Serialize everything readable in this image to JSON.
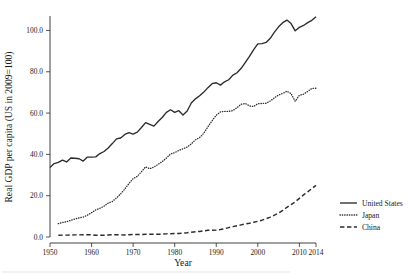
{
  "chart_data": {
    "type": "line",
    "title": "",
    "xlabel": "Year",
    "ylabel": "Real GDP per capita (US in 2009=100)",
    "xlim": [
      1950,
      2014
    ],
    "ylim": [
      0,
      107
    ],
    "grid": false,
    "legend_position": "right",
    "x_tick_labels": [
      "1950",
      "1960",
      "1970",
      "1980",
      "1990",
      "2000",
      "2010",
      "2014"
    ],
    "x_tick_values": [
      1950,
      1960,
      1970,
      1980,
      1990,
      2000,
      2010,
      2014
    ],
    "y_tick_labels": [
      "0.0",
      "20.0",
      "40.0",
      "60.0",
      "80.0",
      "100.0"
    ],
    "y_tick_values": [
      0,
      20,
      40,
      60,
      80,
      100
    ],
    "x": [
      1950,
      1951,
      1952,
      1953,
      1954,
      1955,
      1956,
      1957,
      1958,
      1959,
      1960,
      1961,
      1962,
      1963,
      1964,
      1965,
      1966,
      1967,
      1968,
      1969,
      1970,
      1971,
      1972,
      1973,
      1974,
      1975,
      1976,
      1977,
      1978,
      1979,
      1980,
      1981,
      1982,
      1983,
      1984,
      1985,
      1986,
      1987,
      1988,
      1989,
      1990,
      1991,
      1992,
      1993,
      1994,
      1995,
      1996,
      1997,
      1998,
      1999,
      2000,
      2001,
      2002,
      2003,
      2004,
      2005,
      2006,
      2007,
      2008,
      2009,
      2010,
      2011,
      2012,
      2013,
      2014
    ],
    "series": [
      {
        "name": "United States",
        "style": "solid",
        "color": "#2b2b2b",
        "values": [
          29.8,
          31.5,
          32.0,
          33.0,
          32.2,
          33.9,
          33.8,
          33.6,
          32.6,
          34.3,
          34.3,
          34.4,
          35.8,
          36.7,
          38.2,
          40.1,
          42.1,
          42.5,
          44.0,
          44.8,
          44.2,
          45.0,
          47.0,
          49.1,
          48.3,
          47.6,
          49.6,
          51.3,
          53.5,
          54.6,
          53.5,
          54.2,
          52.4,
          54.1,
          57.5,
          59.3,
          60.6,
          62.2,
          64.1,
          65.8,
          66.2,
          65.2,
          66.6,
          67.5,
          69.5,
          70.5,
          72.4,
          75.0,
          77.5,
          80.4,
          82.9,
          83.0,
          83.5,
          85.3,
          87.9,
          90.2,
          92.0,
          93.1,
          91.6,
          88.5,
          90.0,
          90.8,
          92.0,
          93.0,
          94.5
        ],
        "note": "rises from about 29.8 in 1950 to a 2007 peak near 105.5 (plotted scale), dips in 2009, recovers to about 106.5 by 2014"
      },
      {
        "name": "Japan",
        "style": "dotted",
        "color": "#2b2b2b",
        "values": [
          null,
          null,
          4.9,
          5.3,
          5.6,
          6.1,
          6.6,
          7.0,
          7.3,
          8.0,
          8.9,
          9.9,
          10.5,
          11.3,
          12.4,
          13.0,
          14.3,
          15.8,
          17.6,
          19.6,
          21.4,
          22.2,
          23.9,
          25.7,
          25.0,
          25.6,
          26.6,
          27.6,
          28.9,
          30.4,
          30.9,
          31.7,
          32.3,
          32.9,
          34.1,
          35.6,
          36.4,
          38.0,
          40.4,
          42.6,
          44.6,
          45.8,
          46.0,
          46.0,
          46.3,
          47.4,
          48.6,
          48.9,
          48.0,
          47.8,
          48.8,
          48.9,
          49.0,
          49.8,
          51.0,
          52.0,
          52.6,
          53.4,
          52.5,
          49.7,
          51.9,
          52.3,
          53.3,
          54.4,
          54.5
        ],
        "note": "starts near 5 in 1952, climbs steeply through the 1960s-80s, peaks about 68 in 1996-97, plateaus near 66-72 and ends near 72 in 2014"
      },
      {
        "name": "China",
        "style": "dashed",
        "color": "#2b2b2b",
        "values": [
          null,
          null,
          1.6,
          1.7,
          1.7,
          1.8,
          1.9,
          1.9,
          2.1,
          2.1,
          2.0,
          1.5,
          1.5,
          1.6,
          1.8,
          2.0,
          2.1,
          1.9,
          1.8,
          2.0,
          2.2,
          2.3,
          2.3,
          2.4,
          2.4,
          2.5,
          2.4,
          2.6,
          2.8,
          3.0,
          3.1,
          3.2,
          3.5,
          3.8,
          4.3,
          4.7,
          5.0,
          5.5,
          6.0,
          6.1,
          6.2,
          6.7,
          7.5,
          8.4,
          9.3,
          10.1,
          10.9,
          11.7,
          12.4,
          13.2,
          14.1,
          15.1,
          16.4,
          17.9,
          19.6,
          21.6,
          23.9,
          26.7,
          29.1,
          31.6,
          34.7,
          37.8,
          40.6,
          43.5,
          46.4
        ],
        "note": "flat near 1.5-3 until about 1980, then accelerates steadily to about 25 by 2014"
      }
    ],
    "legend": [
      {
        "label": "United States",
        "style": "solid"
      },
      {
        "label": "Japan",
        "style": "dotted"
      },
      {
        "label": "China",
        "style": "dashed"
      }
    ]
  }
}
